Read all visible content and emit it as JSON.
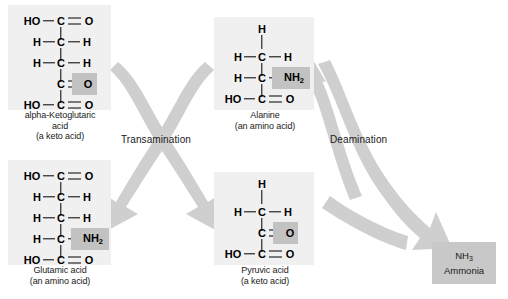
{
  "diagram": {
    "arrow_color": "#cfcfcf",
    "panel_bg": "#f0f0f0",
    "highlight_color": "#c2c2c2",
    "ammonia_box_color": "#c8c8c8",
    "text_color": "#1a1a1a"
  },
  "processes": [
    {
      "id": "transamination",
      "label": "Transamination"
    },
    {
      "id": "deamination",
      "label": "Deamination"
    }
  ],
  "molecules": [
    {
      "id": "alpha-ketoglutaric-acid",
      "name": "alpha-Ketoglutaric",
      "name_line2": "acid",
      "classification": "(a keto acid)",
      "carbons": 5,
      "rows": [
        {
          "left": "HO",
          "center": "C",
          "right": "O",
          "left_bond": "single",
          "right_bond": "double"
        },
        {
          "left": "H",
          "center": "C",
          "right": "H",
          "left_bond": "single",
          "right_bond": "single"
        },
        {
          "left": "H",
          "center": "C",
          "right": "H",
          "left_bond": "single",
          "right_bond": "single"
        },
        {
          "left": "",
          "center": "C",
          "right": "O",
          "left_bond": "none",
          "right_bond": "double",
          "highlight": "right"
        },
        {
          "left": "HO",
          "center": "C",
          "right": "O",
          "left_bond": "single",
          "right_bond": "double"
        }
      ]
    },
    {
      "id": "alanine",
      "name": "Alanine",
      "name_line2": "",
      "classification": "(an amino acid)",
      "carbons": 3,
      "rows": [
        {
          "left": "",
          "center": "H",
          "right": "",
          "left_bond": "none",
          "right_bond": "none",
          "is_cap": true
        },
        {
          "left": "H",
          "center": "C",
          "right": "H",
          "left_bond": "single",
          "right_bond": "single"
        },
        {
          "left": "H",
          "center": "C",
          "right": "NH2",
          "left_bond": "single",
          "right_bond": "single",
          "highlight": "right"
        },
        {
          "left": "HO",
          "center": "C",
          "right": "O",
          "left_bond": "single",
          "right_bond": "double"
        }
      ]
    },
    {
      "id": "glutamic-acid",
      "name": "Glutamic acid",
      "name_line2": "",
      "classification": "(an amino acid)",
      "carbons": 5,
      "rows": [
        {
          "left": "HO",
          "center": "C",
          "right": "O",
          "left_bond": "single",
          "right_bond": "double"
        },
        {
          "left": "H",
          "center": "C",
          "right": "H",
          "left_bond": "single",
          "right_bond": "single"
        },
        {
          "left": "H",
          "center": "C",
          "right": "H",
          "left_bond": "single",
          "right_bond": "single"
        },
        {
          "left": "H",
          "center": "C",
          "right": "NH2",
          "left_bond": "single",
          "right_bond": "single",
          "highlight": "right"
        },
        {
          "left": "HO",
          "center": "C",
          "right": "O",
          "left_bond": "single",
          "right_bond": "double"
        }
      ]
    },
    {
      "id": "pyruvic-acid",
      "name": "Pyruvic acid",
      "name_line2": "",
      "classification": "(a keto acid)",
      "carbons": 3,
      "rows": [
        {
          "left": "",
          "center": "H",
          "right": "",
          "left_bond": "none",
          "right_bond": "none",
          "is_cap": true
        },
        {
          "left": "H",
          "center": "C",
          "right": "H",
          "left_bond": "single",
          "right_bond": "single"
        },
        {
          "left": "",
          "center": "C",
          "right": "O",
          "left_bond": "none",
          "right_bond": "double",
          "highlight": "right"
        },
        {
          "left": "HO",
          "center": "C",
          "right": "O",
          "left_bond": "single",
          "right_bond": "double"
        }
      ]
    }
  ],
  "product": {
    "id": "ammonia",
    "formula": "NH",
    "formula_sub": "3",
    "name": "Ammonia"
  },
  "labels": {
    "ketoglutaric_name": "alpha-Ketoglutaric",
    "ketoglutaric_name2": "acid",
    "ketoglutaric_class": "(a keto acid)",
    "alanine_name": "Alanine",
    "alanine_class": "(an amino acid)",
    "glutamic_name": "Glutamic acid",
    "glutamic_class": "(an amino acid)",
    "pyruvic_name": "Pyruvic acid",
    "pyruvic_class": "(a keto acid)",
    "transamination": "Transamination",
    "deamination": "Deamination",
    "ammonia_formula": "NH",
    "ammonia_sub": "3",
    "ammonia_name": "Ammonia"
  }
}
